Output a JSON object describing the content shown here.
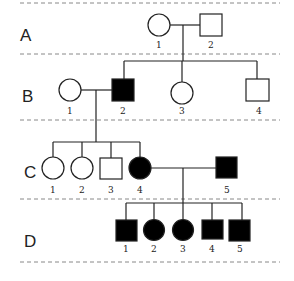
{
  "diagram": {
    "type": "pedigree",
    "generations": [
      {
        "id": "A",
        "label": "A",
        "y": 34,
        "members": [
          {
            "num": "1",
            "sex": "female",
            "affected": false,
            "x": 159
          },
          {
            "num": "2",
            "sex": "male",
            "affected": false,
            "x": 211
          }
        ]
      },
      {
        "id": "B",
        "label": "B",
        "y": 90,
        "members": [
          {
            "num": "1",
            "sex": "female",
            "affected": false,
            "x": 70
          },
          {
            "num": "2",
            "sex": "male",
            "affected": true,
            "x": 123
          },
          {
            "num": "3",
            "sex": "female",
            "affected": false,
            "x": 182
          },
          {
            "num": "4",
            "sex": "male",
            "affected": false,
            "x": 258
          }
        ]
      },
      {
        "id": "C",
        "label": "C",
        "y": 168,
        "members": [
          {
            "num": "1",
            "sex": "female",
            "affected": false,
            "x": 53
          },
          {
            "num": "2",
            "sex": "female",
            "affected": false,
            "x": 82
          },
          {
            "num": "3",
            "sex": "male",
            "affected": false,
            "x": 111
          },
          {
            "num": "4",
            "sex": "female",
            "affected": true,
            "x": 140
          },
          {
            "num": "5",
            "sex": "male",
            "affected": true,
            "x": 227
          }
        ]
      },
      {
        "id": "D",
        "label": "D",
        "y": 230,
        "members": [
          {
            "num": "1",
            "sex": "male",
            "affected": true,
            "x": 127
          },
          {
            "num": "2",
            "sex": "female",
            "affected": true,
            "x": 154
          },
          {
            "num": "3",
            "sex": "female",
            "affected": true,
            "x": 183
          },
          {
            "num": "4",
            "sex": "male",
            "affected": true,
            "x": 212
          },
          {
            "num": "5",
            "sex": "male",
            "affected": true,
            "x": 240
          }
        ]
      }
    ],
    "colors": {
      "affected": "#000000",
      "unaffected": "#ffffff",
      "line": "#222222",
      "divider": "#888888"
    }
  }
}
